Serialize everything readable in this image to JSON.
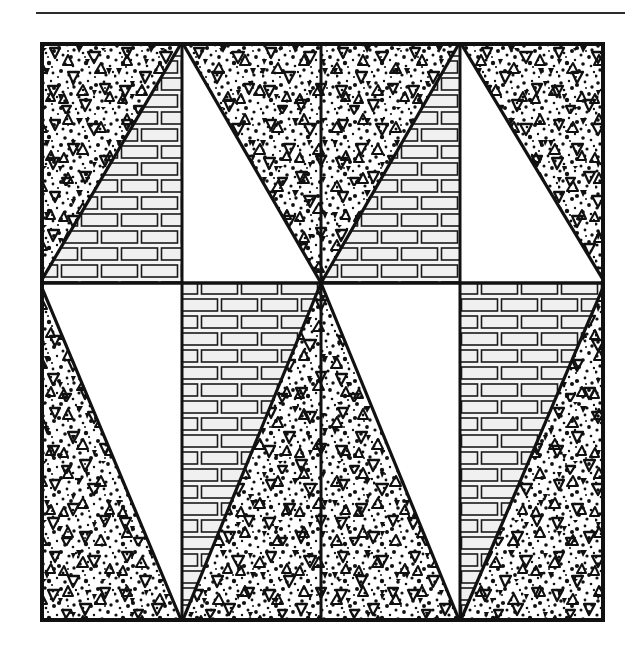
{
  "page": {
    "width": 641,
    "height": 654,
    "background": "#ffffff",
    "ink_color": "#1a1a1a"
  },
  "top_rule": {
    "name": "horizontal-rule",
    "x": 36,
    "y": 12,
    "width": 589,
    "thickness": 2,
    "color": "#2b2b2b"
  },
  "figure": {
    "title": "",
    "caption": "",
    "frame": {
      "x": 40,
      "y": 42,
      "width": 565,
      "height": 580,
      "border_color": "#111111",
      "border_width": 4
    },
    "grid": {
      "columns": 4,
      "rows": 2,
      "column_edges": [
        0,
        142,
        281,
        420,
        565
      ],
      "row_edges": [
        0,
        241,
        580
      ]
    },
    "fills": {
      "stipple": {
        "label": "stippled-aggregate",
        "background": "#ffffff",
        "dot_color": "#101010",
        "symbol": "open-triangle"
      },
      "brick": {
        "label": "brick-masonry",
        "background": "#f2f2f2",
        "mortar_color": "#ffffff",
        "line_color": "#1a1a1a",
        "brick_width": 40,
        "brick_height": 17
      },
      "blank": {
        "label": "blank-white",
        "background": "#ffffff"
      }
    },
    "cells": [
      {
        "id": "r0c0",
        "row": 0,
        "col": 0,
        "diagonal": "bl-tr",
        "fill_a": "stipple",
        "fill_b": "brick"
      },
      {
        "id": "r0c1",
        "row": 0,
        "col": 1,
        "diagonal": "tl-br",
        "fill_a": "blank",
        "fill_b": "stipple"
      },
      {
        "id": "r0c2",
        "row": 0,
        "col": 2,
        "diagonal": "bl-tr",
        "fill_a": "stipple",
        "fill_b": "brick"
      },
      {
        "id": "r0c3",
        "row": 0,
        "col": 3,
        "diagonal": "tl-br",
        "fill_a": "blank",
        "fill_b": "stipple"
      },
      {
        "id": "r1c0",
        "row": 1,
        "col": 0,
        "diagonal": "tl-br",
        "fill_a": "blank",
        "fill_b": "stipple"
      },
      {
        "id": "r1c1",
        "row": 1,
        "col": 1,
        "diagonal": "bl-tr",
        "fill_a": "brick",
        "fill_b": "stipple"
      },
      {
        "id": "r1c2",
        "row": 1,
        "col": 2,
        "diagonal": "tl-br",
        "fill_a": "blank",
        "fill_b": "stipple"
      },
      {
        "id": "r1c3",
        "row": 1,
        "col": 3,
        "diagonal": "bl-tr",
        "fill_a": "brick",
        "fill_b": "stipple"
      }
    ]
  }
}
